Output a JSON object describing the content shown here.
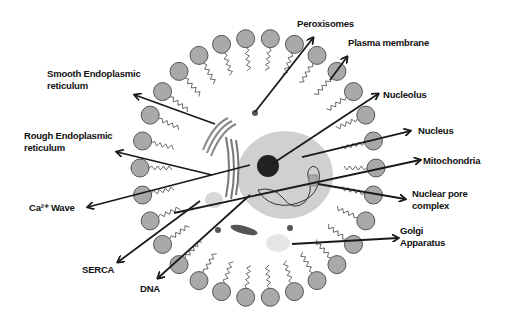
{
  "diagram": {
    "center": {
      "x": 258,
      "y": 168
    },
    "membrane": {
      "rx": 118,
      "ry": 130,
      "head_radius": 9,
      "head_color": "#a9a9a9",
      "head_stroke": "#555555",
      "count": 30
    },
    "nucleus": {
      "cx": 285,
      "cy": 175,
      "rx": 48,
      "ry": 44,
      "color": "#d0d0d0"
    },
    "nucleolus": {
      "cx": 268,
      "cy": 166,
      "r": 11,
      "color": "#222222"
    },
    "labels": [
      {
        "id": "peroxisomes",
        "text": "Peroxisomes",
        "x": 297,
        "y": 18
      },
      {
        "id": "plasma-membrane",
        "text": "Plasma  membrane",
        "x": 348,
        "y": 37
      },
      {
        "id": "smooth-er",
        "text": "Smooth Endoplasmic\nreticulum",
        "x": 47,
        "y": 68
      },
      {
        "id": "nucleolus",
        "text": "Nucleolus",
        "x": 383,
        "y": 89
      },
      {
        "id": "rough-er",
        "text": "Rough Endoplasmic\nreticulum",
        "x": 24,
        "y": 130
      },
      {
        "id": "nucleus",
        "text": "Nucleus",
        "x": 418,
        "y": 125
      },
      {
        "id": "mitochondria",
        "text": "Mitochondria",
        "x": 423,
        "y": 155
      },
      {
        "id": "nuclear-pore",
        "text": "Nuclear pore\ncomplex",
        "x": 412,
        "y": 188
      },
      {
        "id": "ca-wave",
        "text": "Ca²⁺ Wave",
        "x": 29,
        "y": 202
      },
      {
        "id": "golgi",
        "text": "Golgi\nApparatus",
        "x": 400,
        "y": 225
      },
      {
        "id": "serca",
        "text": "SERCA",
        "x": 82,
        "y": 264
      },
      {
        "id": "dna",
        "text": "DNA",
        "x": 140,
        "y": 283
      }
    ],
    "arrows": [
      {
        "id": "peroxisomes",
        "x1": 255,
        "y1": 112,
        "x2": 313,
        "y2": 38
      },
      {
        "id": "plasma-membrane",
        "x1": 330,
        "y1": 80,
        "x2": 347,
        "y2": 57
      },
      {
        "id": "smooth-er",
        "x1": 215,
        "y1": 124,
        "x2": 135,
        "y2": 95
      },
      {
        "id": "nucleolus",
        "x1": 272,
        "y1": 164,
        "x2": 378,
        "y2": 94
      },
      {
        "id": "rough-er",
        "x1": 212,
        "y1": 175,
        "x2": 117,
        "y2": 152
      },
      {
        "id": "nucleus",
        "x1": 302,
        "y1": 157,
        "x2": 410,
        "y2": 131
      },
      {
        "id": "mitochondria",
        "x1": 174,
        "y1": 213,
        "x2": 420,
        "y2": 160
      },
      {
        "id": "nuclear-pore",
        "x1": 318,
        "y1": 184,
        "x2": 405,
        "y2": 199
      },
      {
        "id": "ca-wave",
        "x1": 250,
        "y1": 165,
        "x2": 88,
        "y2": 207
      },
      {
        "id": "golgi",
        "x1": 292,
        "y1": 244,
        "x2": 398,
        "y2": 238
      },
      {
        "id": "serca",
        "x1": 200,
        "y1": 201,
        "x2": 118,
        "y2": 262
      },
      {
        "id": "dna",
        "x1": 250,
        "y1": 195,
        "x2": 158,
        "y2": 278
      }
    ],
    "colors": {
      "arrow": "#1a1a1a",
      "organelle": "#9a9a9a",
      "background": "#ffffff"
    }
  }
}
